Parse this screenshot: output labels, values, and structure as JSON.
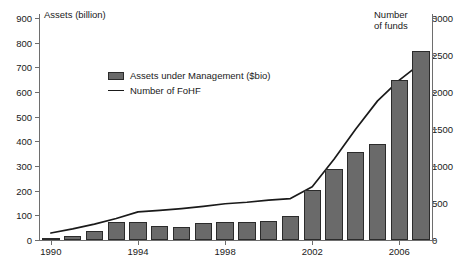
{
  "chart_data": {
    "type": "bar",
    "title": "",
    "xlabel": "",
    "ylabel": "Assets (billion)",
    "y2label": "Number\nof funds",
    "ylim": [
      0,
      900
    ],
    "y2lim": [
      0,
      3000
    ],
    "yticks": [
      0,
      100,
      200,
      300,
      400,
      500,
      600,
      700,
      800,
      900
    ],
    "y2ticks": [
      0,
      500,
      1000,
      1500,
      2000,
      2500,
      3000
    ],
    "xticks": [
      "1990",
      "1994",
      "1998",
      "2002",
      "2006"
    ],
    "xtick_years": [
      1990,
      1994,
      1998,
      2002,
      2006
    ],
    "grid": false,
    "legend_position": "upper-left-inside",
    "categories": [
      1990,
      1991,
      1992,
      1993,
      1994,
      1995,
      1996,
      1997,
      1998,
      1999,
      2000,
      2001,
      2002,
      2003,
      2004,
      2005,
      2006,
      2007
    ],
    "series": [
      {
        "name": "Assets under Management ($bio)",
        "type": "bar",
        "axis": "left",
        "unit": "$bio",
        "color": "#6a6a6a",
        "edge_color": "#2b2b2b",
        "values": [
          2,
          18,
          36,
          74,
          73,
          55,
          51,
          71,
          73,
          73,
          79,
          99,
          203,
          288,
          355,
          391,
          649,
          767
        ]
      },
      {
        "name": "Number of FoHF",
        "type": "line",
        "axis": "right",
        "unit": "funds",
        "color": "#1a1a1a",
        "values": [
          95,
          150,
          215,
          290,
          380,
          400,
          425,
          455,
          490,
          510,
          540,
          560,
          720,
          1090,
          1500,
          1880,
          2160,
          2390
        ]
      }
    ]
  },
  "legend": {
    "items": [
      {
        "label": "Assets under Management ($bio)",
        "marker": "bar-swatch"
      },
      {
        "label": "Number of FoHF",
        "marker": "line-swatch"
      }
    ]
  },
  "axes": {
    "left_title": "Assets (billion)",
    "right_title": "Number\nof funds"
  }
}
